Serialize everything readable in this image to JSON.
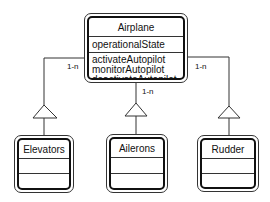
{
  "diagram": {
    "type": "UML class diagram",
    "parent": {
      "name": "Airplane",
      "attributes": [
        "operationalState"
      ],
      "operations": [
        "activateAutopilot",
        "monitorAutopilot",
        "deactivateAutopilot"
      ]
    },
    "children": [
      {
        "name": "Elevators",
        "multiplicity": "1-n"
      },
      {
        "name": "Ailerons",
        "multiplicity": "1-n"
      },
      {
        "name": "Rudder",
        "multiplicity": "1-n"
      }
    ],
    "relationship": "generalization"
  }
}
